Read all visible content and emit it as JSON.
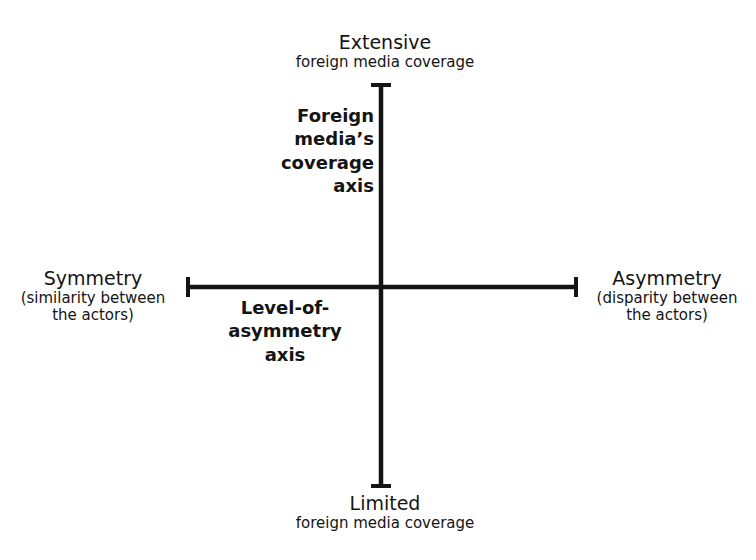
{
  "diagram": {
    "type": "two-axis quadrant diagram",
    "colors": {
      "background": "#ffffff",
      "ink": "#141414"
    },
    "vertical_axis": {
      "name_lines": [
        "Foreign",
        "media’s",
        "coverage",
        "axis"
      ],
      "top_end": {
        "title": "Extensive",
        "subtitle": "foreign media coverage"
      },
      "bottom_end": {
        "title": "Limited",
        "subtitle": "foreign media coverage"
      }
    },
    "horizontal_axis": {
      "name_lines": [
        "Level-of-",
        "asymmetry",
        "axis"
      ],
      "left_end": {
        "title": "Symmetry",
        "subtitle_lines": [
          "(similarity between",
          "the actors)"
        ]
      },
      "right_end": {
        "title": "Asymmetry",
        "subtitle_lines": [
          "(disparity between",
          "the actors)"
        ]
      }
    }
  }
}
